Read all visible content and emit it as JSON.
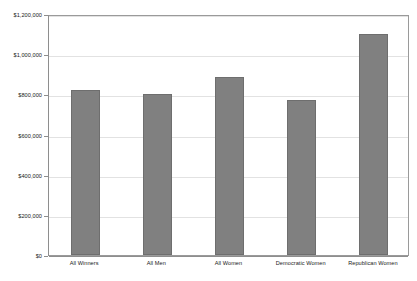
{
  "chart_data": {
    "type": "bar",
    "title": "",
    "subtitle": "",
    "xlabel": "",
    "ylabel": "",
    "categories": [
      "All Winners",
      "All Men",
      "All Women",
      "Democratic Women",
      "Republican Women"
    ],
    "values": [
      821000,
      803000,
      886000,
      771000,
      1100000
    ],
    "series": [
      {
        "name": "Average amount",
        "values": [
          821000,
          803000,
          886000,
          771000,
          1100000
        ]
      }
    ],
    "ylim": [
      0,
      1200000
    ],
    "ytick_values": [
      0,
      200000,
      400000,
      600000,
      800000,
      1000000,
      1200000
    ],
    "ytick_labels": [
      "$0",
      "$200,000",
      "$400,000",
      "$600,000",
      "$800,000",
      "$1,000,000",
      "$1,200,000"
    ],
    "grid": true,
    "legend": false,
    "legend_position": "none",
    "bar_color": "#808080",
    "bar_edge_color": "#6e6e6e",
    "grid_color": "#e2e2e2",
    "axis_color": "#8e8e8e",
    "background_color": "#ffffff"
  }
}
